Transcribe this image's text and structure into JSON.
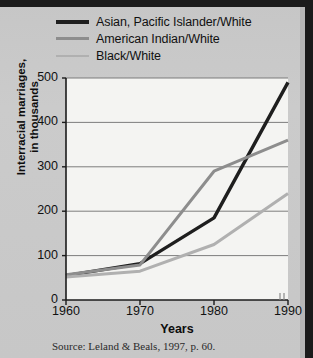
{
  "figure": {
    "source_note": "Source:  Leland & Beals, 1997, p. 60."
  },
  "chart_data": {
    "type": "line",
    "title": "",
    "xlabel": "Years",
    "ylabel": "Interracial marriages, in thousands",
    "ylabel_line1": "Interracial marriages,",
    "ylabel_line2": "in thousands",
    "x": [
      1960,
      1970,
      1980,
      1990
    ],
    "categories": [
      "1960",
      "1970",
      "1980",
      "1990"
    ],
    "xticklabels": [
      "1960",
      "1970",
      "1980",
      "1990"
    ],
    "yticklabels": [
      "0",
      "100",
      "200",
      "300",
      "400",
      "500"
    ],
    "yticks": [
      0,
      100,
      200,
      300,
      400,
      500
    ],
    "xlim": [
      1960,
      1990
    ],
    "ylim": [
      0,
      500
    ],
    "grid": "horizontal",
    "legend_position": "above-plot",
    "series": [
      {
        "name": "Asian, Pacific Islander/White",
        "color": "#1e1e1e",
        "width": 3.4,
        "values": [
          55,
          82,
          185,
          490
        ]
      },
      {
        "name": "American Indian/White",
        "color": "#8d8d8d",
        "width": 3.0,
        "values": [
          57,
          79,
          290,
          360
        ]
      },
      {
        "name": "Black/White",
        "color": "#b0b0b0",
        "width": 3.0,
        "values": [
          52,
          65,
          125,
          240
        ]
      }
    ]
  },
  "legend": {
    "items": [
      {
        "label": "Asian, Pacific Islander/White",
        "color": "#1e1e1e",
        "thickness": "4px"
      },
      {
        "label": "American Indian/White",
        "color": "#8d8d8d",
        "thickness": "3px"
      },
      {
        "label": "Black/White",
        "color": "#b0b0b0",
        "thickness": "2.5px"
      }
    ]
  }
}
